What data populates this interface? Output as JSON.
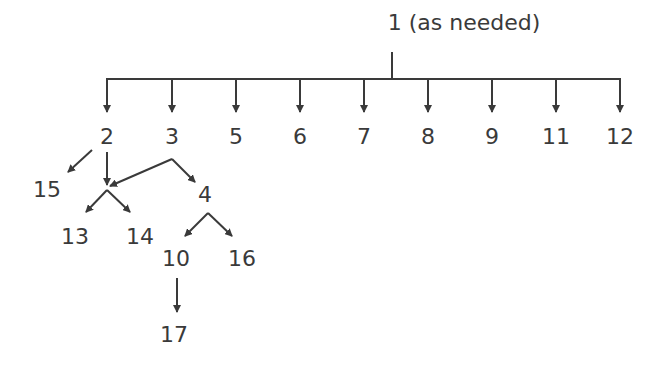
{
  "diagram": {
    "root": {
      "id": "1",
      "label": "1 (as needed)",
      "x": 464,
      "y": 30
    },
    "trunk": {
      "stem_x": 392,
      "stem_top": 52,
      "bar_y": 79,
      "bar_left": 107,
      "bar_right": 620,
      "arrow_end_y": 112
    },
    "top_level": [
      {
        "id": "2",
        "label": "2",
        "x": 107,
        "y": 144
      },
      {
        "id": "3",
        "label": "3",
        "x": 172,
        "y": 144
      },
      {
        "id": "5",
        "label": "5",
        "x": 236,
        "y": 144
      },
      {
        "id": "6",
        "label": "6",
        "x": 300,
        "y": 144
      },
      {
        "id": "7",
        "label": "7",
        "x": 364,
        "y": 144
      },
      {
        "id": "8",
        "label": "8",
        "x": 428,
        "y": 144
      },
      {
        "id": "9",
        "label": "9",
        "x": 492,
        "y": 144
      },
      {
        "id": "11",
        "label": "11",
        "x": 556,
        "y": 144
      },
      {
        "id": "12",
        "label": "12",
        "x": 620,
        "y": 144
      }
    ],
    "sub_nodes": [
      {
        "id": "15",
        "label": "15",
        "x": 47,
        "y": 197
      },
      {
        "id": "4",
        "label": "4",
        "x": 205,
        "y": 202
      },
      {
        "id": "13",
        "label": "13",
        "x": 75,
        "y": 244
      },
      {
        "id": "14",
        "label": "14",
        "x": 140,
        "y": 244
      },
      {
        "id": "10",
        "label": "10",
        "x": 176,
        "y": 266
      },
      {
        "id": "16",
        "label": "16",
        "x": 242,
        "y": 266
      },
      {
        "id": "17",
        "label": "17",
        "x": 174,
        "y": 342
      }
    ],
    "edges": [
      {
        "from": "2",
        "to": "15",
        "x1": 92,
        "y1": 150,
        "x2": 68,
        "y2": 172
      },
      {
        "from": "2",
        "to": "join",
        "x1": 107,
        "y1": 152,
        "x2": 107,
        "y2": 185
      },
      {
        "from": "3",
        "to": "join",
        "x1": 172,
        "y1": 159,
        "x2": 110,
        "y2": 186
      },
      {
        "from": "3",
        "to": "4",
        "x1": 172,
        "y1": 159,
        "x2": 195,
        "y2": 182
      },
      {
        "from": "join",
        "to": "13",
        "x1": 107,
        "y1": 190,
        "x2": 86,
        "y2": 212
      },
      {
        "from": "join",
        "to": "14",
        "x1": 107,
        "y1": 190,
        "x2": 130,
        "y2": 212
      },
      {
        "from": "4",
        "to": "10",
        "x1": 208,
        "y1": 213,
        "x2": 185,
        "y2": 236
      },
      {
        "from": "4",
        "to": "16",
        "x1": 208,
        "y1": 213,
        "x2": 232,
        "y2": 236
      },
      {
        "from": "10",
        "to": "17",
        "x1": 177,
        "y1": 278,
        "x2": 177,
        "y2": 312
      }
    ],
    "color": "#3a3a3a"
  }
}
